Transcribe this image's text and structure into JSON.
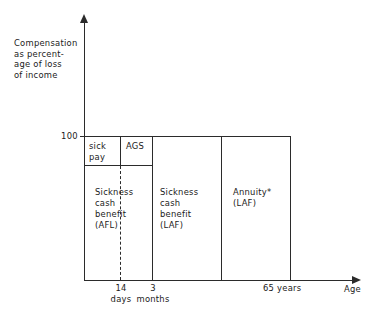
{
  "chart_data": {
    "type": "diagram",
    "title": "",
    "xlabel": "Age",
    "ylabel": "Compensation as percent-\nage of loss\nof income",
    "y_ticks": [
      "100"
    ],
    "x_ticks": [
      "14\ndays",
      "3\nmonths",
      "65 years"
    ],
    "grid": false,
    "legend": "none",
    "blocks": [
      {
        "label": "sick\npay",
        "row": "top",
        "x_start": "0",
        "x_end": "14 days",
        "y": "100"
      },
      {
        "label": "AGS",
        "row": "top",
        "x_start": "14 days",
        "x_end": "3 months",
        "y": "100"
      },
      {
        "label": "Sickness\ncash\nbenefit\n(AFL)",
        "row": "bottom",
        "x_start": "0",
        "x_end": "3 months"
      },
      {
        "label": "Sickness\ncash\nbenefit\n(LAF)",
        "row": "full",
        "x_start": "3 months",
        "x_end": "mid"
      },
      {
        "label": "Annuity*\n(LAF)",
        "row": "full",
        "x_start": "mid",
        "x_end": "65 years"
      }
    ]
  },
  "axes": {
    "y_title": "Compensation\nas percent-\nage of loss\nof income",
    "y_tick_100": "100",
    "x_title": "Age"
  },
  "blocks": {
    "sick_pay": "sick\npay",
    "ags": "AGS",
    "sickness_afl": "Sickness\ncash\nbenefit\n(AFL)",
    "sickness_laf": "Sickness\ncash\nbenefit\n(LAF)",
    "annuity": "Annuity*\n(LAF)"
  },
  "x_ticks": {
    "fourteen_days": "14\ndays",
    "three_months": "3\nmonths",
    "sixtyfive_years": "65 years"
  },
  "colors": {
    "stroke": "#2b2b2b",
    "background": "#ffffff",
    "text": "#1a1a1a"
  }
}
